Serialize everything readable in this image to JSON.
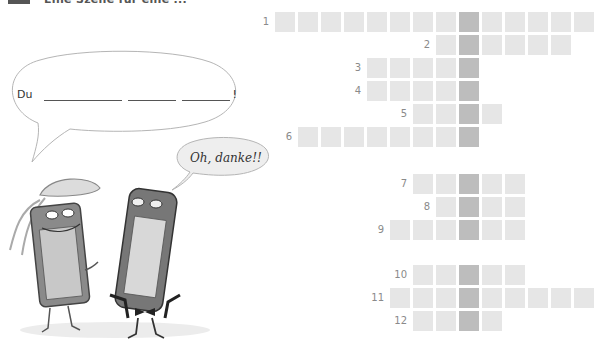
{
  "header": {
    "exercise_number": "",
    "title": "Eine Szene für eine ..."
  },
  "bubbles": {
    "large": {
      "prefix": "Du",
      "blank_count": 3,
      "suffix": "!"
    },
    "small": {
      "text": "Oh, danke!!"
    }
  },
  "characters": [
    {
      "name": "female-phone-character",
      "description": "smiling phone with ponytail"
    },
    {
      "name": "male-phone-character",
      "description": "phone in tuxedo with bow tie"
    }
  ],
  "crossword": {
    "colors": {
      "cell": "#e6e6e6",
      "key_column": "#bdbdbd",
      "number": "#8a8a8a"
    },
    "rows": [
      {
        "number": "1",
        "from": -8,
        "to": 5
      },
      {
        "number": "2",
        "from": -1,
        "to": 4
      },
      {
        "number": "3",
        "from": -4,
        "to": 0
      },
      {
        "number": "4",
        "from": -4,
        "to": 0
      },
      {
        "number": "5",
        "from": -2,
        "to": 1
      },
      {
        "number": "6",
        "from": -7,
        "to": 0
      },
      {
        "number": "7",
        "from": -2,
        "to": 2
      },
      {
        "number": "8",
        "from": -1,
        "to": 2
      },
      {
        "number": "9",
        "from": -3,
        "to": 2
      },
      {
        "number": "10",
        "from": -2,
        "to": 2
      },
      {
        "number": "11",
        "from": -3,
        "to": 5
      },
      {
        "number": "12",
        "from": -2,
        "to": 1
      }
    ]
  }
}
